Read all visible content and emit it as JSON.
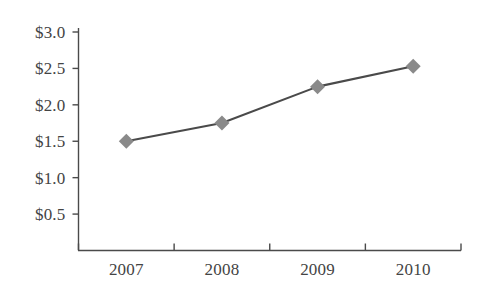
{
  "chart_data": {
    "type": "line",
    "title": "",
    "subtitle": "",
    "xlabel": "",
    "ylabel": "",
    "categories": [
      "2007",
      "2008",
      "2009",
      "2010"
    ],
    "series": [
      {
        "name": "",
        "values": [
          1.5,
          1.75,
          2.25,
          2.53
        ],
        "line_color": "#4a4a4a",
        "marker_color": "#8a8a8a",
        "marker_shape": "diamond"
      }
    ],
    "ylim": [
      0,
      3.0
    ],
    "y_ticks": [
      0.5,
      1.0,
      1.5,
      2.0,
      2.5,
      3.0
    ],
    "y_tick_labels": [
      "$0.5",
      "$1.0",
      "$1.5",
      "$2.0",
      "$2.5",
      "$3.0"
    ],
    "x_tick_labels": [
      "2007",
      "2008",
      "2009",
      "2010"
    ],
    "grid": false,
    "legend": false,
    "legend_position": "none"
  },
  "axes": {
    "y_axis_name": "y-axis",
    "x_axis_name": "x-axis"
  }
}
